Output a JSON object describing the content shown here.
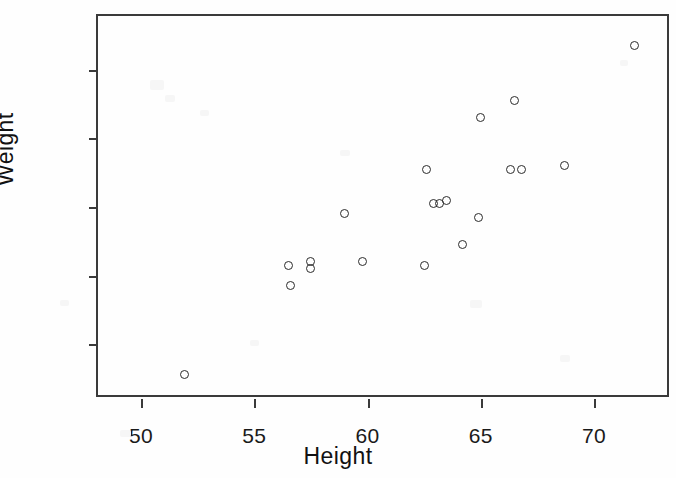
{
  "chart_data": {
    "type": "scatter",
    "title": "",
    "xlabel": "Height",
    "ylabel": "Weight",
    "xlim": [
      48.1,
      73.4
    ],
    "ylim": [
      44.0,
      155.7
    ],
    "xticks": [
      50,
      55,
      60,
      65,
      70
    ],
    "yticks": [
      60,
      80,
      100,
      120,
      140
    ],
    "xticklabels": [
      "50",
      "55",
      "60",
      "65",
      "70"
    ],
    "yticklabels": [
      "60",
      "80",
      "100",
      "120",
      "140"
    ],
    "grid": false,
    "legend": null,
    "marker": "open-circle",
    "marker_color": "#2b2b2b",
    "frame_color": "#3a3a3a",
    "background": "#ffffff",
    "series": [
      {
        "name": "observations",
        "x": [
          51.9,
          56.5,
          56.6,
          57.5,
          57.5,
          59.0,
          59.8,
          62.5,
          62.6,
          62.9,
          63.2,
          63.5,
          64.2,
          64.9,
          65.0,
          66.3,
          66.5,
          66.8,
          68.7,
          71.8
        ],
        "y": [
          51,
          83,
          77,
          84,
          82,
          98,
          84,
          83,
          111,
          101,
          101,
          102,
          89,
          97,
          126,
          111,
          131,
          111,
          112,
          147
        ],
        "points": [
          {
            "height": 51.9,
            "weight": 51
          },
          {
            "height": 56.5,
            "weight": 83
          },
          {
            "height": 56.6,
            "weight": 77
          },
          {
            "height": 57.5,
            "weight": 84
          },
          {
            "height": 57.5,
            "weight": 82
          },
          {
            "height": 59.0,
            "weight": 98
          },
          {
            "height": 59.8,
            "weight": 84
          },
          {
            "height": 62.5,
            "weight": 83
          },
          {
            "height": 62.6,
            "weight": 111
          },
          {
            "height": 62.9,
            "weight": 101
          },
          {
            "height": 63.2,
            "weight": 101
          },
          {
            "height": 63.5,
            "weight": 102
          },
          {
            "height": 64.2,
            "weight": 89
          },
          {
            "height": 64.9,
            "weight": 97
          },
          {
            "height": 65.0,
            "weight": 126
          },
          {
            "height": 66.3,
            "weight": 111
          },
          {
            "height": 66.5,
            "weight": 131
          },
          {
            "height": 66.8,
            "weight": 111
          },
          {
            "height": 68.7,
            "weight": 112
          },
          {
            "height": 71.8,
            "weight": 147
          }
        ]
      }
    ]
  }
}
